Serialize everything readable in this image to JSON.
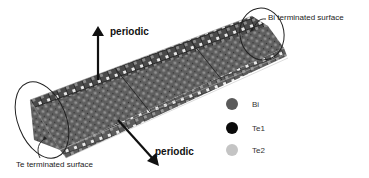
{
  "figure": {
    "labels": {
      "periodic_top": "periodic",
      "periodic_bottom": "periodic",
      "bi_surface": "Bi terminated surface",
      "te_surface": "Te terminated surface"
    },
    "legend": [
      {
        "label": "Bi",
        "color": "#5a5a5a",
        "icon": "bi-atom-icon"
      },
      {
        "label": "Te1",
        "color": "#0a0a0a",
        "icon": "te1-atom-icon"
      },
      {
        "label": "Te2",
        "color": "#c4c4c4",
        "icon": "te2-atom-icon"
      }
    ],
    "colors": {
      "slab_dark": "#3a3a3a",
      "slab_mid": "#6e6e6e",
      "bond_light": "#e6e6e6",
      "outline": "#222222"
    }
  }
}
